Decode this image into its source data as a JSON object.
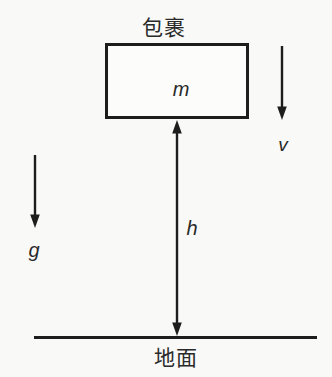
{
  "diagram": {
    "package_label": "包裹",
    "mass_symbol": "m",
    "velocity_symbol": "v",
    "gravity_symbol": "g",
    "height_symbol": "h",
    "ground_label": "地面",
    "colors": {
      "line": "#1d1d1d",
      "text": "#2a2a2a",
      "background": "#f9f9f8"
    }
  }
}
